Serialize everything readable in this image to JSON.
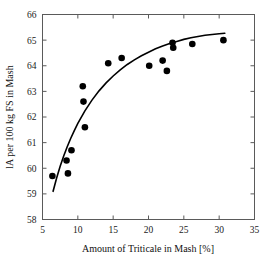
{
  "chart_data": {
    "type": "scatter",
    "title": "",
    "xlabel": "Amount of Triticale in Mash [%]",
    "ylabel": "lA per 100 kg FS in Mash",
    "xlim": [
      5,
      35
    ],
    "ylim": [
      58,
      66
    ],
    "xticks": [
      5,
      10,
      15,
      20,
      25,
      30,
      35
    ],
    "yticks": [
      58,
      59,
      60,
      61,
      62,
      63,
      64,
      65,
      66
    ],
    "xtick_labels": [
      "5",
      "10",
      "15",
      "20",
      "25",
      "30",
      "35"
    ],
    "ytick_labels": [
      "58",
      "59",
      "60",
      "61",
      "62",
      "63",
      "64",
      "65",
      "66"
    ],
    "grid": false,
    "legend": "none",
    "marker": "filled-circle",
    "marker_color": "#000000",
    "curve_color": "#000000",
    "points": [
      {
        "x": 6.4,
        "y": 59.7
      },
      {
        "x": 8.4,
        "y": 60.3
      },
      {
        "x": 8.6,
        "y": 59.8
      },
      {
        "x": 9.1,
        "y": 60.7
      },
      {
        "x": 10.7,
        "y": 63.2
      },
      {
        "x": 10.8,
        "y": 62.6
      },
      {
        "x": 11.0,
        "y": 61.6
      },
      {
        "x": 14.3,
        "y": 64.1
      },
      {
        "x": 16.2,
        "y": 64.3
      },
      {
        "x": 20.1,
        "y": 64.0
      },
      {
        "x": 22.0,
        "y": 64.2
      },
      {
        "x": 22.6,
        "y": 63.8
      },
      {
        "x": 23.4,
        "y": 64.9
      },
      {
        "x": 23.5,
        "y": 64.7
      },
      {
        "x": 26.2,
        "y": 64.85
      },
      {
        "x": 30.6,
        "y": 65.0
      }
    ],
    "curve": [
      {
        "x": 6.5,
        "y": 59.1
      },
      {
        "x": 7.0,
        "y": 59.62
      },
      {
        "x": 7.5,
        "y": 60.08
      },
      {
        "x": 8.0,
        "y": 60.48
      },
      {
        "x": 8.5,
        "y": 60.84
      },
      {
        "x": 9.0,
        "y": 61.17
      },
      {
        "x": 9.5,
        "y": 61.47
      },
      {
        "x": 10.0,
        "y": 61.75
      },
      {
        "x": 11.0,
        "y": 62.24
      },
      {
        "x": 12.0,
        "y": 62.66
      },
      {
        "x": 13.0,
        "y": 63.02
      },
      {
        "x": 14.0,
        "y": 63.33
      },
      {
        "x": 15.0,
        "y": 63.6
      },
      {
        "x": 16.0,
        "y": 63.84
      },
      {
        "x": 17.0,
        "y": 64.05
      },
      {
        "x": 18.0,
        "y": 64.23
      },
      {
        "x": 19.0,
        "y": 64.39
      },
      {
        "x": 20.0,
        "y": 64.53
      },
      {
        "x": 21.0,
        "y": 64.66
      },
      {
        "x": 22.0,
        "y": 64.77
      },
      {
        "x": 23.0,
        "y": 64.87
      },
      {
        "x": 24.0,
        "y": 64.95
      },
      {
        "x": 25.0,
        "y": 65.03
      },
      {
        "x": 26.0,
        "y": 65.09
      },
      {
        "x": 27.0,
        "y": 65.14
      },
      {
        "x": 28.0,
        "y": 65.19
      },
      {
        "x": 29.0,
        "y": 65.22
      },
      {
        "x": 30.0,
        "y": 65.25
      },
      {
        "x": 30.8,
        "y": 65.27
      }
    ]
  }
}
